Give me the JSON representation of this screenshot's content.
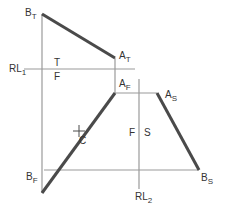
{
  "diagram": {
    "colors": {
      "thin_line": "#9a9a9a",
      "thick_line": "#4a4a4a",
      "text": "#333333"
    },
    "points": {
      "B_T": {
        "label": "B",
        "sub": "T",
        "x": 42,
        "y": 14
      },
      "A_T": {
        "label": "A",
        "sub": "T",
        "x": 115,
        "y": 58
      },
      "A_F": {
        "label": "A",
        "sub": "F",
        "x": 115,
        "y": 93
      },
      "B_F": {
        "label": "B",
        "sub": "F",
        "x": 42,
        "y": 193
      },
      "A_S": {
        "label": "A",
        "sub": "S",
        "x": 157,
        "y": 93
      },
      "B_S": {
        "label": "B",
        "sub": "S",
        "x": 199,
        "y": 170
      },
      "C": {
        "label": "C",
        "x": 79,
        "y": 131
      }
    },
    "reference_lines": [
      {
        "label": "RL",
        "sub": "1",
        "side_a": "T",
        "side_b": "F"
      },
      {
        "label": "RL",
        "sub": "2",
        "side_a": "F",
        "side_b": "S"
      }
    ],
    "labels": {
      "bt_main": "B",
      "bt_sub": "T",
      "at_main": "A",
      "at_sub": "T",
      "af_main": "A",
      "af_sub": "F",
      "bf_main": "B",
      "bf_sub": "F",
      "as_main": "A",
      "as_sub": "S",
      "bs_main": "B",
      "bs_sub": "S",
      "c": "C",
      "rl1_main": "RL",
      "rl1_sub": "1",
      "rl2_main": "RL",
      "rl2_sub": "2",
      "t": "T",
      "f1": "F",
      "f2": "F",
      "s": "S"
    }
  }
}
